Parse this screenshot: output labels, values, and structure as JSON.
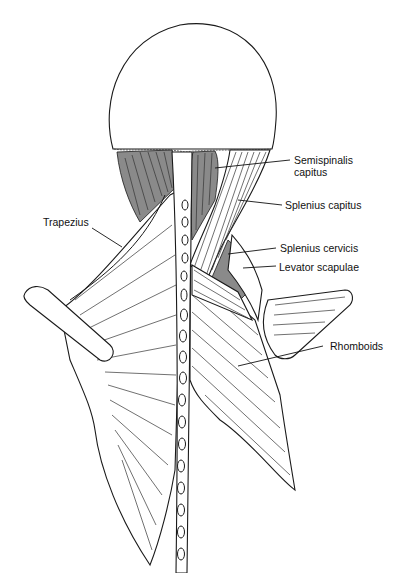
{
  "figure": {
    "labels": [
      {
        "id": "semispinalis-capitus",
        "text_line1": "Semispinalis",
        "text_line2": "capitus"
      },
      {
        "id": "splenius-capitus",
        "text_line1": "Splenius capitus"
      },
      {
        "id": "trapezius",
        "text_line1": "Trapezius"
      },
      {
        "id": "splenius-cervicis",
        "text_line1": "Splenius cervicis"
      },
      {
        "id": "levator-scapulae",
        "text_line1": "Levator scapulae"
      },
      {
        "id": "rhomboids",
        "text_line1": "Rhomboids"
      }
    ]
  },
  "colors": {
    "line": "#1a1a1a",
    "shade": "#8a8a8a",
    "background": "#ffffff"
  }
}
